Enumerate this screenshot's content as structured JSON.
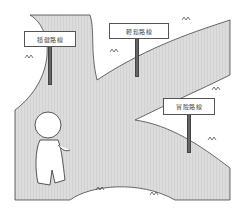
{
  "illustration": {
    "description": "Cartoon figure standing at a fork in a path with three signposts",
    "colors": {
      "path": "#d8d8d8",
      "grass": "#ffffff",
      "outline": "#444444",
      "post": "#666666"
    },
    "signs": [
      {
        "label": "穩健路線"
      },
      {
        "label": "輕鬆路線"
      },
      {
        "label": "冒險路線"
      }
    ]
  }
}
